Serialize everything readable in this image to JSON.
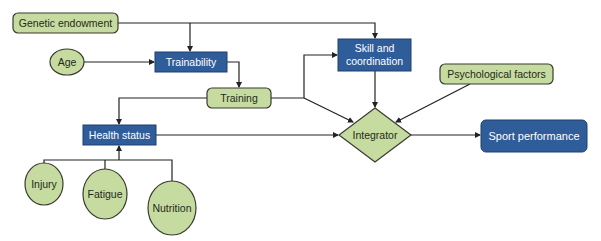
{
  "diagram": {
    "title": "",
    "colors": {
      "green_fill": "#c6dba0",
      "green_stroke": "#3a3a30",
      "blue_fill": "#2f5d9a",
      "blue_stroke": "#1e3e6e",
      "line": "#222222"
    },
    "nodes": {
      "genetic_endowment": {
        "label": "Genetic endowment",
        "shape": "rounded-rect",
        "color": "green"
      },
      "age": {
        "label": "Age",
        "shape": "ellipse",
        "color": "green"
      },
      "trainability": {
        "label": "Trainability",
        "shape": "rect",
        "color": "blue"
      },
      "training": {
        "label": "Training",
        "shape": "rounded-rect",
        "color": "green"
      },
      "skill_coordination": {
        "label_line1": "Skill and",
        "label_line2": "coordination",
        "shape": "rect",
        "color": "blue"
      },
      "psychological_factors": {
        "label": "Psychological factors",
        "shape": "rounded-rect",
        "color": "green"
      },
      "health_status": {
        "label": "Health status",
        "shape": "rect",
        "color": "blue"
      },
      "integrator": {
        "label": "Integrator",
        "shape": "diamond",
        "color": "green"
      },
      "sport_performance": {
        "label": "Sport performance",
        "shape": "rounded-rect",
        "color": "blue"
      },
      "injury": {
        "label": "Injury",
        "shape": "ellipse",
        "color": "green"
      },
      "fatigue": {
        "label": "Fatigue",
        "shape": "ellipse",
        "color": "green"
      },
      "nutrition": {
        "label": "Nutrition",
        "shape": "ellipse",
        "color": "green"
      }
    },
    "edges": [
      {
        "from": "Genetic endowment",
        "to": "Trainability"
      },
      {
        "from": "Genetic endowment",
        "to": "Skill and coordination"
      },
      {
        "from": "Age",
        "to": "Trainability"
      },
      {
        "from": "Trainability",
        "to": "Training"
      },
      {
        "from": "Training",
        "to": "Skill and coordination"
      },
      {
        "from": "Training",
        "to": "Integrator"
      },
      {
        "from": "Training",
        "to": "Health status"
      },
      {
        "from": "Skill and coordination",
        "to": "Integrator"
      },
      {
        "from": "Psychological factors",
        "to": "Integrator"
      },
      {
        "from": "Health status",
        "to": "Integrator"
      },
      {
        "from": "Integrator",
        "to": "Sport performance"
      },
      {
        "from": "Injury",
        "to": "Health status"
      },
      {
        "from": "Fatigue",
        "to": "Health status"
      },
      {
        "from": "Nutrition",
        "to": "Health status"
      }
    ]
  }
}
